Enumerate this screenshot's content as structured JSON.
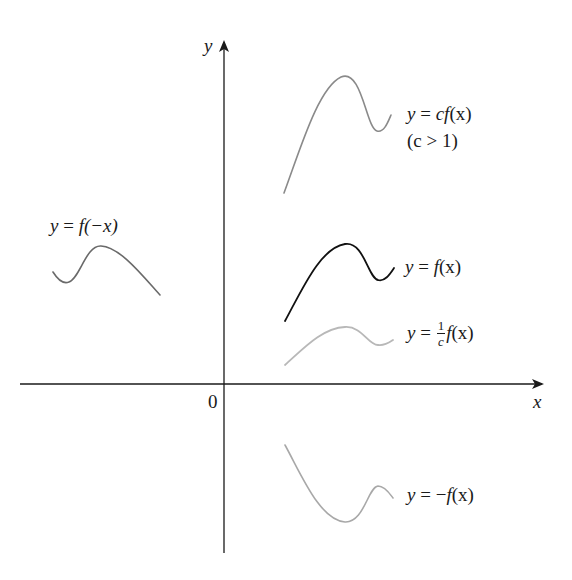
{
  "figure": {
    "type": "function-transformation-diagram",
    "axes": {
      "x_label": "x",
      "y_label": "y",
      "origin_label": "0"
    },
    "curves": [
      {
        "id": "cf",
        "label": "y = cf(x)",
        "note": "(c > 1)",
        "color": "#8a8a8a",
        "style": "gray"
      },
      {
        "id": "f",
        "label": "y = f(x)",
        "color": "#111111",
        "style": "black"
      },
      {
        "id": "inv_c_f",
        "label_prefix": "y = ",
        "frac_num": "1",
        "frac_den": "c",
        "label_suffix": "f(x)",
        "color": "#b5b5b5",
        "style": "light-gray"
      },
      {
        "id": "f_neg_x",
        "label": "y = f(−x)",
        "color": "#6a6a6a",
        "style": "dark-gray"
      },
      {
        "id": "neg_f",
        "label": "y = −f(x)",
        "color": "#a8a8a8",
        "style": "gray"
      }
    ]
  },
  "labels": {
    "y_axis": "y",
    "x_axis": "x",
    "origin": "0",
    "cf_eq_y": "y",
    "cf_eq_rest": " = ",
    "cf_eq_c": "c",
    "cf_eq_f": "f",
    "cf_eq_x": "(x)",
    "cf_note": "(c > 1)",
    "f_eq_y": "y",
    "f_eq_eq": " = ",
    "f_eq_f": "f",
    "f_eq_x": "(x)",
    "invc_eq_y": "y",
    "invc_eq_eq": " = ",
    "invc_num": "1",
    "invc_den": "c",
    "invc_f": "f",
    "invc_x": "(x)",
    "fnegx_y": "y",
    "fnegx_eq": " = ",
    "fnegx_f": "f",
    "fnegx_arg": "(−x)",
    "negf_y": "y",
    "negf_eq": " = −",
    "negf_f": "f",
    "negf_x": "(x)"
  },
  "colors": {
    "axis": "#1a1a1a",
    "f": "#111111",
    "cf": "#8a8a8a",
    "inv_c_f": "#b8b8b8",
    "f_neg_x": "#6a6a6a",
    "neg_f": "#a8a8a8"
  }
}
